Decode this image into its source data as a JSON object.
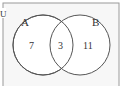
{
  "diagram": {
    "type": "venn",
    "universal_label": "U",
    "sets": [
      {
        "label": "A",
        "only_value": "7"
      },
      {
        "label": "B",
        "only_value": "11"
      }
    ],
    "intersection_value": "3",
    "colors": {
      "background": "#f7f7f7",
      "stroke": "#555555",
      "text": "#333333"
    }
  }
}
